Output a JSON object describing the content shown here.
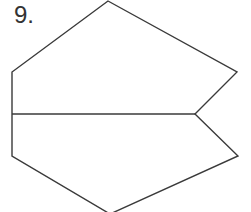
{
  "problem": {
    "number_label": "9."
  },
  "figure": {
    "stroke_color": "#3a3a3a",
    "outline_points": "108,1 237,72 195,114 238,156 110,214 12,156 12,72",
    "divider": {
      "x1": 12,
      "y1": 114,
      "x2": 195,
      "y2": 114
    }
  }
}
